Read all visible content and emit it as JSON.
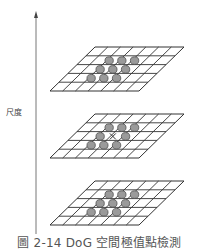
{
  "figure": {
    "caption": "圖 2-14  DoG 空間極值點檢測",
    "axis_label": "尺度",
    "colors": {
      "grid_line": "#333333",
      "circle_fill": "#9a9a9a",
      "circle_stroke": "#444444",
      "axis": "#555555",
      "caption_text": "#555555"
    },
    "planes": [
      {
        "name": "upper-scale",
        "top_y": 47,
        "has_center_marker": false
      },
      {
        "name": "current-scale",
        "top_y": 114,
        "has_center_marker": true
      },
      {
        "name": "lower-scale",
        "top_y": 181,
        "has_center_marker": false
      }
    ],
    "grid": {
      "cols": 7,
      "rows": 5,
      "width": 89,
      "height": 44,
      "skew": 45
    },
    "neighbor_circles_per_plane": 9
  }
}
